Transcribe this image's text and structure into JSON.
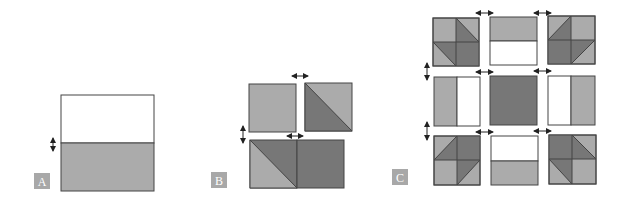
{
  "colors": {
    "light": "#ababab",
    "dark": "#777777",
    "white": "#ffffff",
    "stroke": "#444444",
    "label_bg": "#a8a8a8",
    "label_text": "#ffffff",
    "arrow": "#222222"
  },
  "panels": [
    {
      "id": "A",
      "label": "A"
    },
    {
      "id": "B",
      "label": "B"
    },
    {
      "id": "C",
      "label": "C"
    }
  ]
}
